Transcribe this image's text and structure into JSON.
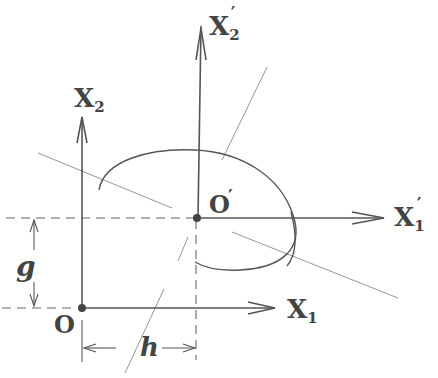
{
  "diagram": {
    "labels": {
      "x2_axis": "X",
      "x2_sub": "2",
      "x2p_axis": "X",
      "x2p_sub": "2",
      "x2p_prime": "′",
      "x1_axis": "X",
      "x1_sub": "1",
      "x1p_axis": "X",
      "x1p_sub": "1",
      "x1p_prime": "′",
      "origin": "O",
      "origin_prime": "O",
      "origin_prime_mark": "′",
      "offset_vertical": "g",
      "offset_horizontal": "h"
    },
    "colors": {
      "ink": "#444444",
      "background": "#ffffff"
    }
  }
}
